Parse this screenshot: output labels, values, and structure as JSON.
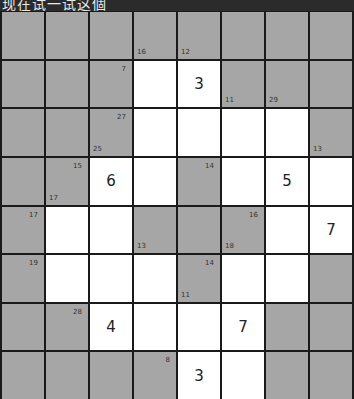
{
  "header": {
    "title": "现在试一试这個"
  },
  "colors": {
    "block": "#a6a6a6",
    "white": "#ffffff",
    "grid_line": "#1a1a1a",
    "title_bg": "#2b2b2b"
  },
  "puzzle": {
    "type": "kakuro",
    "cols": 8,
    "rows": 8,
    "cells": [
      [
        {
          "t": "b"
        },
        {
          "t": "b"
        },
        {
          "t": "b"
        },
        {
          "t": "b",
          "bl": "16"
        },
        {
          "t": "b",
          "bl": "12"
        },
        {
          "t": "b"
        },
        {
          "t": "b"
        },
        {
          "t": "b"
        }
      ],
      [
        {
          "t": "b"
        },
        {
          "t": "b"
        },
        {
          "t": "b",
          "tr": "7"
        },
        {
          "t": "w",
          "v": ""
        },
        {
          "t": "w",
          "v": "3"
        },
        {
          "t": "b",
          "bl": "11"
        },
        {
          "t": "b",
          "bl": "29"
        },
        {
          "t": "b"
        }
      ],
      [
        {
          "t": "b"
        },
        {
          "t": "b"
        },
        {
          "t": "b",
          "tr": "27",
          "bl": "25"
        },
        {
          "t": "w",
          "v": ""
        },
        {
          "t": "w",
          "v": ""
        },
        {
          "t": "w",
          "v": ""
        },
        {
          "t": "w",
          "v": ""
        },
        {
          "t": "b",
          "bl": "13"
        }
      ],
      [
        {
          "t": "b"
        },
        {
          "t": "b",
          "tr": "15",
          "bl": "17"
        },
        {
          "t": "w",
          "v": "6"
        },
        {
          "t": "w",
          "v": ""
        },
        {
          "t": "b",
          "tr": "14"
        },
        {
          "t": "w",
          "v": ""
        },
        {
          "t": "w",
          "v": "5"
        },
        {
          "t": "w",
          "v": ""
        }
      ],
      [
        {
          "t": "b",
          "tr": "17"
        },
        {
          "t": "w",
          "v": ""
        },
        {
          "t": "w",
          "v": ""
        },
        {
          "t": "b",
          "bl": "13"
        },
        {
          "t": "b"
        },
        {
          "t": "b",
          "tr": "16",
          "bl": "18"
        },
        {
          "t": "w",
          "v": ""
        },
        {
          "t": "w",
          "v": "7"
        }
      ],
      [
        {
          "t": "b",
          "tr": "19"
        },
        {
          "t": "w",
          "v": ""
        },
        {
          "t": "w",
          "v": ""
        },
        {
          "t": "w",
          "v": ""
        },
        {
          "t": "b",
          "tr": "14",
          "bl": "11"
        },
        {
          "t": "w",
          "v": ""
        },
        {
          "t": "w",
          "v": ""
        },
        {
          "t": "b"
        }
      ],
      [
        {
          "t": "b"
        },
        {
          "t": "b",
          "tr": "28"
        },
        {
          "t": "w",
          "v": "4"
        },
        {
          "t": "w",
          "v": ""
        },
        {
          "t": "w",
          "v": ""
        },
        {
          "t": "w",
          "v": "7"
        },
        {
          "t": "b"
        },
        {
          "t": "b"
        }
      ],
      [
        {
          "t": "b"
        },
        {
          "t": "b"
        },
        {
          "t": "b"
        },
        {
          "t": "b",
          "tr": "8"
        },
        {
          "t": "w",
          "v": "3"
        },
        {
          "t": "w",
          "v": ""
        },
        {
          "t": "b"
        },
        {
          "t": "b"
        }
      ]
    ]
  }
}
